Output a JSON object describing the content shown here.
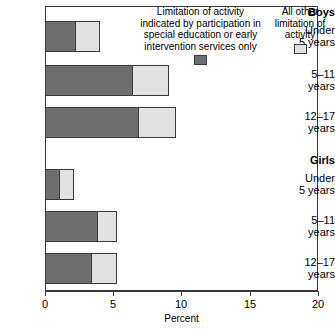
{
  "chart_data": {
    "type": "bar",
    "orientation": "horizontal",
    "stacked": true,
    "title": "",
    "xlabel": "Percent",
    "ylabel": "",
    "xlim": [
      0,
      20
    ],
    "xticks": [
      "0",
      "5",
      "10",
      "15",
      "20"
    ],
    "grid": false,
    "legend_position": "top-right",
    "groups": [
      {
        "name": "Boys",
        "categories": [
          {
            "label_lines": [
              "Under",
              "5 years"
            ],
            "special_ed_only": 2.2,
            "all_other": 1.8,
            "total": 4.0
          },
          {
            "label_lines": [
              "5–11",
              "years"
            ],
            "special_ed_only": 6.4,
            "all_other": 2.7,
            "total": 9.1
          },
          {
            "label_lines": [
              "12–17",
              "years"
            ],
            "special_ed_only": 6.8,
            "all_other": 2.8,
            "total": 9.6
          }
        ]
      },
      {
        "name": "Girls",
        "categories": [
          {
            "label_lines": [
              "Under",
              "5 years"
            ],
            "special_ed_only": 1.0,
            "all_other": 1.1,
            "total": 2.1
          },
          {
            "label_lines": [
              "5–11",
              "years"
            ],
            "special_ed_only": 3.8,
            "all_other": 1.5,
            "total": 5.3
          },
          {
            "label_lines": [
              "12–17",
              "years"
            ],
            "special_ed_only": 3.4,
            "all_other": 1.9,
            "total": 5.3
          }
        ]
      }
    ],
    "series": [
      {
        "name": "Limitation of activity indicated by participation in special education or early intervention services only",
        "color": "#6e6e6e",
        "values": [
          2.2,
          6.4,
          6.8,
          1.0,
          3.8,
          3.4
        ]
      },
      {
        "name": "All other limitation of activity",
        "color": "#e2e2e2",
        "values": [
          1.8,
          2.7,
          2.8,
          1.1,
          1.5,
          1.9
        ]
      }
    ]
  },
  "legend": {
    "series_a_lines": [
      "Limitation of activity",
      "indicated by participation in",
      "special education or early",
      "intervention services only"
    ],
    "series_b_lines": [
      "All other",
      "limitation of",
      "activity"
    ]
  },
  "axis": {
    "title": "Percent",
    "ticks": [
      "0",
      "5",
      "10",
      "15",
      "20"
    ]
  },
  "labels": {
    "boys": "Boys",
    "girls": "Girls",
    "under5_l1": "Under",
    "under5_l2": "5 years",
    "age5_11_l1": "5–11",
    "age5_11_l2": "years",
    "age12_17_l1": "12–17",
    "age12_17_l2": "years"
  },
  "colors": {
    "dark": "#6e6e6e",
    "light": "#e2e2e2",
    "frame": "#3a3a3a"
  }
}
